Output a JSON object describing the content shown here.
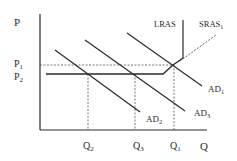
{
  "diagram": {
    "type": "AD-AS model",
    "colors": {
      "line": "#2a2a2a",
      "dashed": "#555555",
      "background": "#ffffff"
    },
    "axes": {
      "y_label": "P",
      "x_label": "Q"
    },
    "price_levels": [
      {
        "id": "P1",
        "base": "P",
        "sub": "1"
      },
      {
        "id": "P2",
        "base": "P",
        "sub": "2"
      }
    ],
    "quantity_levels": [
      {
        "id": "Q2",
        "base": "Q",
        "sub": "2"
      },
      {
        "id": "Q3",
        "base": "Q",
        "sub": "3"
      },
      {
        "id": "Q1",
        "base": "Q",
        "sub": "1"
      }
    ],
    "curves": {
      "lras": {
        "label": "LRAS"
      },
      "sras1": {
        "base": "SRAS",
        "sub": "1"
      },
      "ad1": {
        "base": "AD",
        "sub": "1"
      },
      "ad2": {
        "base": "AD",
        "sub": "2"
      },
      "ad3": {
        "base": "AD",
        "sub": "3"
      }
    }
  }
}
